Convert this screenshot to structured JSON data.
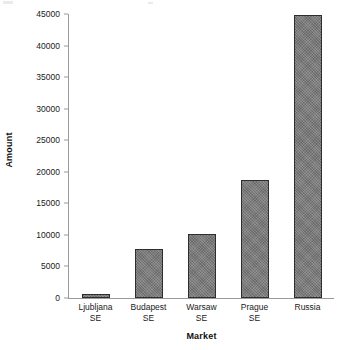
{
  "chart_data": {
    "type": "bar",
    "title": "",
    "xlabel": "Market",
    "ylabel": "Amount",
    "categories": [
      "Ljubljana SE",
      "Budapest SE",
      "Warsaw SE",
      "Prague SE",
      "Russia"
    ],
    "category_lines": [
      [
        "Ljubljana",
        "SE"
      ],
      [
        "Budapest",
        "SE"
      ],
      [
        "Warsaw",
        "SE"
      ],
      [
        "Prague",
        "SE"
      ],
      [
        "Russia",
        ""
      ]
    ],
    "values": [
      650,
      7800,
      10200,
      18700,
      44900
    ],
    "ylim": [
      0,
      45000
    ],
    "ytick_values": [
      0,
      5000,
      10000,
      15000,
      20000,
      25000,
      30000,
      35000,
      40000,
      45000
    ],
    "ytick_labels": [
      "0",
      "5000",
      "10000",
      "15000",
      "20000",
      "25000",
      "30000",
      "35000",
      "40000",
      "45000"
    ],
    "grid": false,
    "legend": false,
    "legend_position": "none",
    "bar_color": "#787878",
    "bar_border_color": "#2e2e2e",
    "axis_color": "#9a9a9a",
    "background_color": "#ffffff",
    "text_color": "#1a1a1a"
  }
}
